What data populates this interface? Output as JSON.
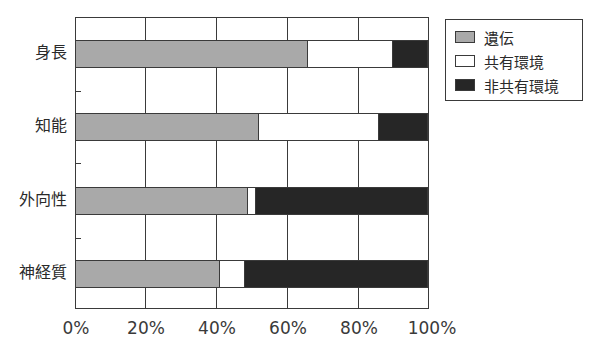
{
  "chart_data": {
    "type": "bar",
    "orientation": "horizontal",
    "stacked": true,
    "title": "",
    "xlabel": "",
    "ylabel": "",
    "xlim": [
      0,
      100
    ],
    "grid": true,
    "legend_position": "top-right",
    "categories": [
      "身長",
      "知能",
      "外向性",
      "神経質"
    ],
    "x_ticks": [
      "0%",
      "20%",
      "40%",
      "60%",
      "80%",
      "100%"
    ],
    "series": [
      {
        "name": "遺伝",
        "key": "gen",
        "color": "#a9a9a9",
        "values": [
          66,
          52,
          49,
          41
        ]
      },
      {
        "name": "共有環境",
        "key": "shared",
        "color": "#ffffff",
        "values": [
          24,
          34,
          2,
          7
        ]
      },
      {
        "name": "非共有環境",
        "key": "nonshared",
        "color": "#262626",
        "values": [
          10,
          14,
          49,
          52
        ]
      }
    ]
  },
  "labels": {
    "categories": [
      "身長",
      "知能",
      "外向性",
      "神経質"
    ],
    "x_ticks": [
      "0%",
      "20%",
      "40%",
      "60%",
      "80%",
      "100%"
    ],
    "legend": [
      "遺伝",
      "共有環境",
      "非共有環境"
    ]
  }
}
